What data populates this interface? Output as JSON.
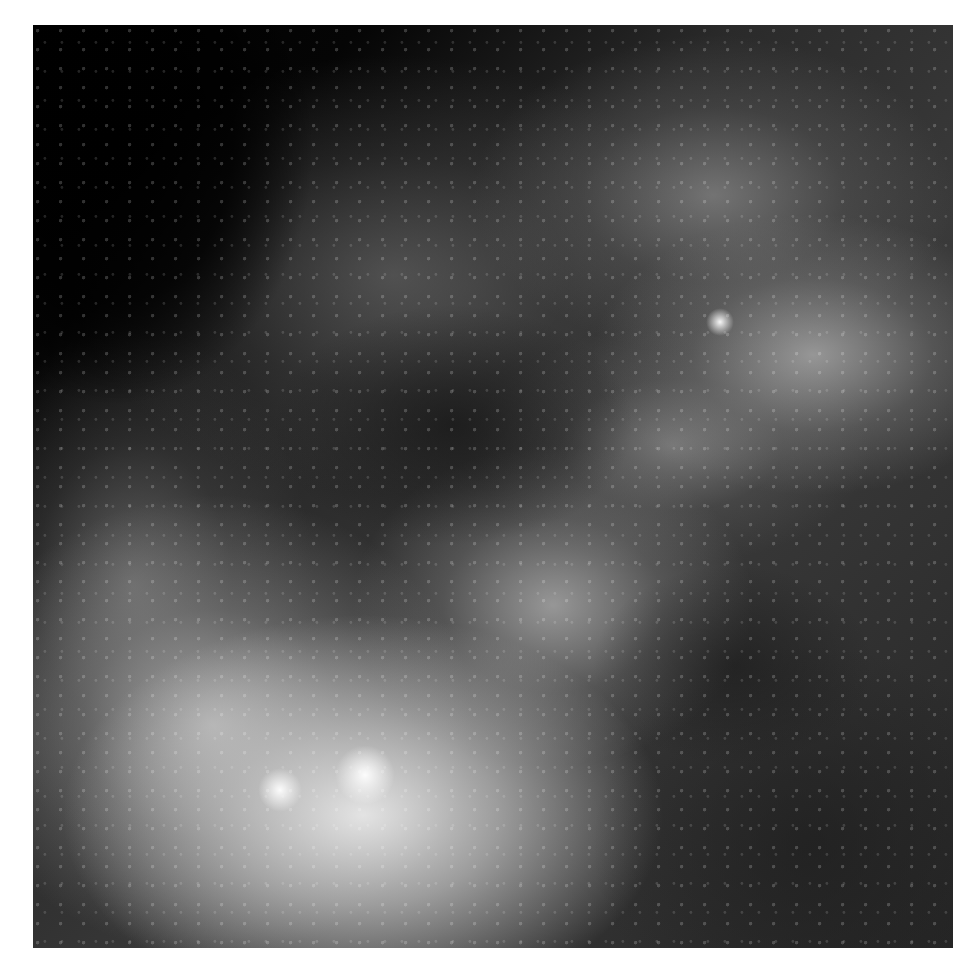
{
  "image": {
    "subject": "grayscale mammogram-style breast tissue radiograph",
    "frame": {
      "left": 33,
      "top": 25,
      "width": 920,
      "height": 923
    },
    "colors": {
      "border": "#ffffff",
      "background_dark": "#000000",
      "tissue_bright": "#ebebeb",
      "tissue_mid": "#8c8c8c",
      "tissue_dark": "#2a2a2a"
    },
    "highlights": [
      {
        "name": "bright-focus-upper-right",
        "x": 720,
        "y": 320,
        "r": 14
      },
      {
        "name": "bright-cluster-lower-center",
        "x": 365,
        "y": 775,
        "r": 30
      },
      {
        "name": "bright-cluster-lower-left",
        "x": 280,
        "y": 790,
        "r": 22
      }
    ]
  }
}
